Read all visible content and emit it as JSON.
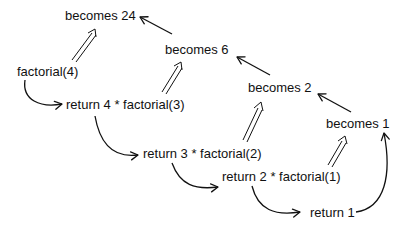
{
  "diagram": {
    "nodes": {
      "call4": "factorial(4)",
      "ret4": "return 4 * factorial(3)",
      "ret3": "return 3 * factorial(2)",
      "ret2": "return 2 * factorial(1)",
      "ret1": "return 1",
      "becomes1": "becomes 1",
      "becomes2": "becomes 2",
      "becomes6": "becomes 6",
      "becomes24": "becomes 24"
    },
    "edges": [
      {
        "from": "factorial(4)",
        "to": "return 4 * factorial(3)",
        "style": "curved-arrow"
      },
      {
        "from": "return 4 * factorial(3)",
        "to": "return 3 * factorial(2)",
        "style": "curved-arrow"
      },
      {
        "from": "return 3 * factorial(2)",
        "to": "return 2 * factorial(1)",
        "style": "curved-arrow"
      },
      {
        "from": "return 2 * factorial(1)",
        "to": "return 1",
        "style": "curved-arrow"
      },
      {
        "from": "return 1",
        "to": "becomes 1",
        "style": "curved-arrow"
      },
      {
        "from": "return 2 * factorial(1)",
        "to": "becomes 1",
        "style": "double-arrow"
      },
      {
        "from": "return 3 * factorial(2)",
        "to": "becomes 2",
        "style": "double-arrow"
      },
      {
        "from": "return 4 * factorial(3)",
        "to": "becomes 6",
        "style": "double-arrow"
      },
      {
        "from": "factorial(4)",
        "to": "becomes 24",
        "style": "double-arrow"
      },
      {
        "from": "becomes 1",
        "to": "becomes 2",
        "style": "arrow"
      },
      {
        "from": "becomes 2",
        "to": "becomes 6",
        "style": "arrow"
      },
      {
        "from": "becomes 6",
        "to": "becomes 24",
        "style": "arrow"
      }
    ],
    "colors": {
      "ink": "#111111",
      "background": "#ffffff"
    }
  }
}
